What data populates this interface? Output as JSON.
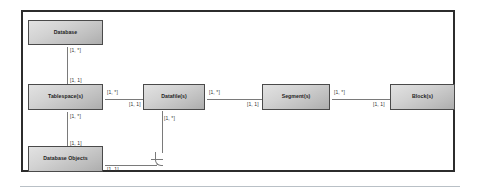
{
  "diagram": {
    "type": "uml-class-diagram",
    "frame_color": "#2c2c2c",
    "node_fill_light": "#e2e2e2",
    "node_fill_dark": "#adadad",
    "node_border_color": "#4a4a4a",
    "connector_color": "#7a7a7a"
  },
  "nodes": [
    {
      "id": "database",
      "label": "Database"
    },
    {
      "id": "tablespace",
      "label": "Tablespace(s)"
    },
    {
      "id": "datafile",
      "label": "Datafile(s)"
    },
    {
      "id": "segment",
      "label": "Segment(s)"
    },
    {
      "id": "block",
      "label": "Block(s)"
    },
    {
      "id": "dbobjects",
      "label": "Database Objects"
    }
  ],
  "connections": [
    {
      "id": "database-tablespace",
      "from": "database",
      "to": "tablespace",
      "orientation": "vertical",
      "source_multiplicity": "[1, *]",
      "target_multiplicity": "[1, 1]"
    },
    {
      "id": "tablespace-datafile",
      "from": "tablespace",
      "to": "datafile",
      "orientation": "horizontal",
      "source_multiplicity": "[1, *]",
      "target_multiplicity": "[1, 1]"
    },
    {
      "id": "datafile-segment",
      "from": "datafile",
      "to": "segment",
      "orientation": "horizontal",
      "source_multiplicity": "[1, *]",
      "target_multiplicity": "[1, 1]"
    },
    {
      "id": "segment-block",
      "from": "segment",
      "to": "block",
      "orientation": "horizontal",
      "source_multiplicity": "[1, *]",
      "target_multiplicity": "[1, 1]"
    },
    {
      "id": "tablespace-dbobjects",
      "from": "tablespace",
      "to": "dbobjects",
      "orientation": "vertical",
      "source_multiplicity": "[1, *]",
      "target_multiplicity": "[1, 1]"
    },
    {
      "id": "dbobjects-datafile",
      "from": "dbobjects",
      "to": "datafile",
      "orientation": "elbow",
      "source_multiplicity": "[1, 1]",
      "target_multiplicity": "[1, *]"
    }
  ]
}
